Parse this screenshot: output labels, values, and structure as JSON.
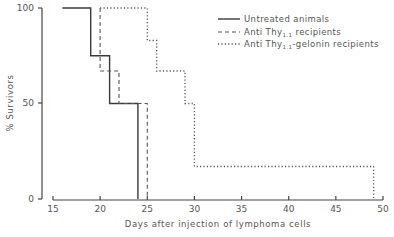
{
  "chart_data": {
    "type": "line",
    "subtype": "step (Kaplan-Meier survival curves)",
    "title": "",
    "xlabel": "Days after injection of lymphoma cells",
    "ylabel": "% Survivors",
    "xlim": [
      15,
      50
    ],
    "ylim": [
      0,
      100
    ],
    "x_ticks": [
      15,
      20,
      25,
      30,
      35,
      40,
      45,
      50
    ],
    "y_ticks": [
      0,
      50,
      100
    ],
    "grid": false,
    "legend_position": "upper right",
    "series": [
      {
        "name": "Untreated animals",
        "line_style": "solid",
        "points": [
          [
            16,
            100
          ],
          [
            19,
            100
          ],
          [
            19,
            75
          ],
          [
            21,
            75
          ],
          [
            21,
            50
          ],
          [
            24,
            50
          ],
          [
            24,
            0
          ]
        ]
      },
      {
        "name": "Anti Thy1.1 recipients",
        "line_style": "dashed",
        "points": [
          [
            20,
            100
          ],
          [
            20,
            67
          ],
          [
            22,
            67
          ],
          [
            22,
            50
          ],
          [
            25,
            50
          ],
          [
            25,
            0
          ]
        ]
      },
      {
        "name": "Anti Thy1.1-gelonin recipients",
        "line_style": "dotted",
        "points": [
          [
            20,
            100
          ],
          [
            25,
            100
          ],
          [
            25,
            83
          ],
          [
            26,
            83
          ],
          [
            26,
            67
          ],
          [
            29,
            67
          ],
          [
            29,
            50
          ],
          [
            30,
            50
          ],
          [
            30,
            17
          ],
          [
            49,
            17
          ],
          [
            49,
            0
          ]
        ]
      }
    ]
  },
  "labels": {
    "ylabel": "% Survivors",
    "xlabel": "Days after injection of lymphoma cells",
    "y_ticks": [
      "100",
      "50",
      "0"
    ],
    "x_ticks": [
      "15",
      "20",
      "25",
      "30",
      "35",
      "40",
      "45",
      "50"
    ],
    "legend": [
      {
        "main": "Untreated animals",
        "sub": "",
        "tail": ""
      },
      {
        "main": "Anti Thy",
        "sub": "1.1",
        "tail": " recipients"
      },
      {
        "main": "Anti Thy",
        "sub": "1.1",
        "tail": "-gelonin recipients"
      }
    ]
  }
}
